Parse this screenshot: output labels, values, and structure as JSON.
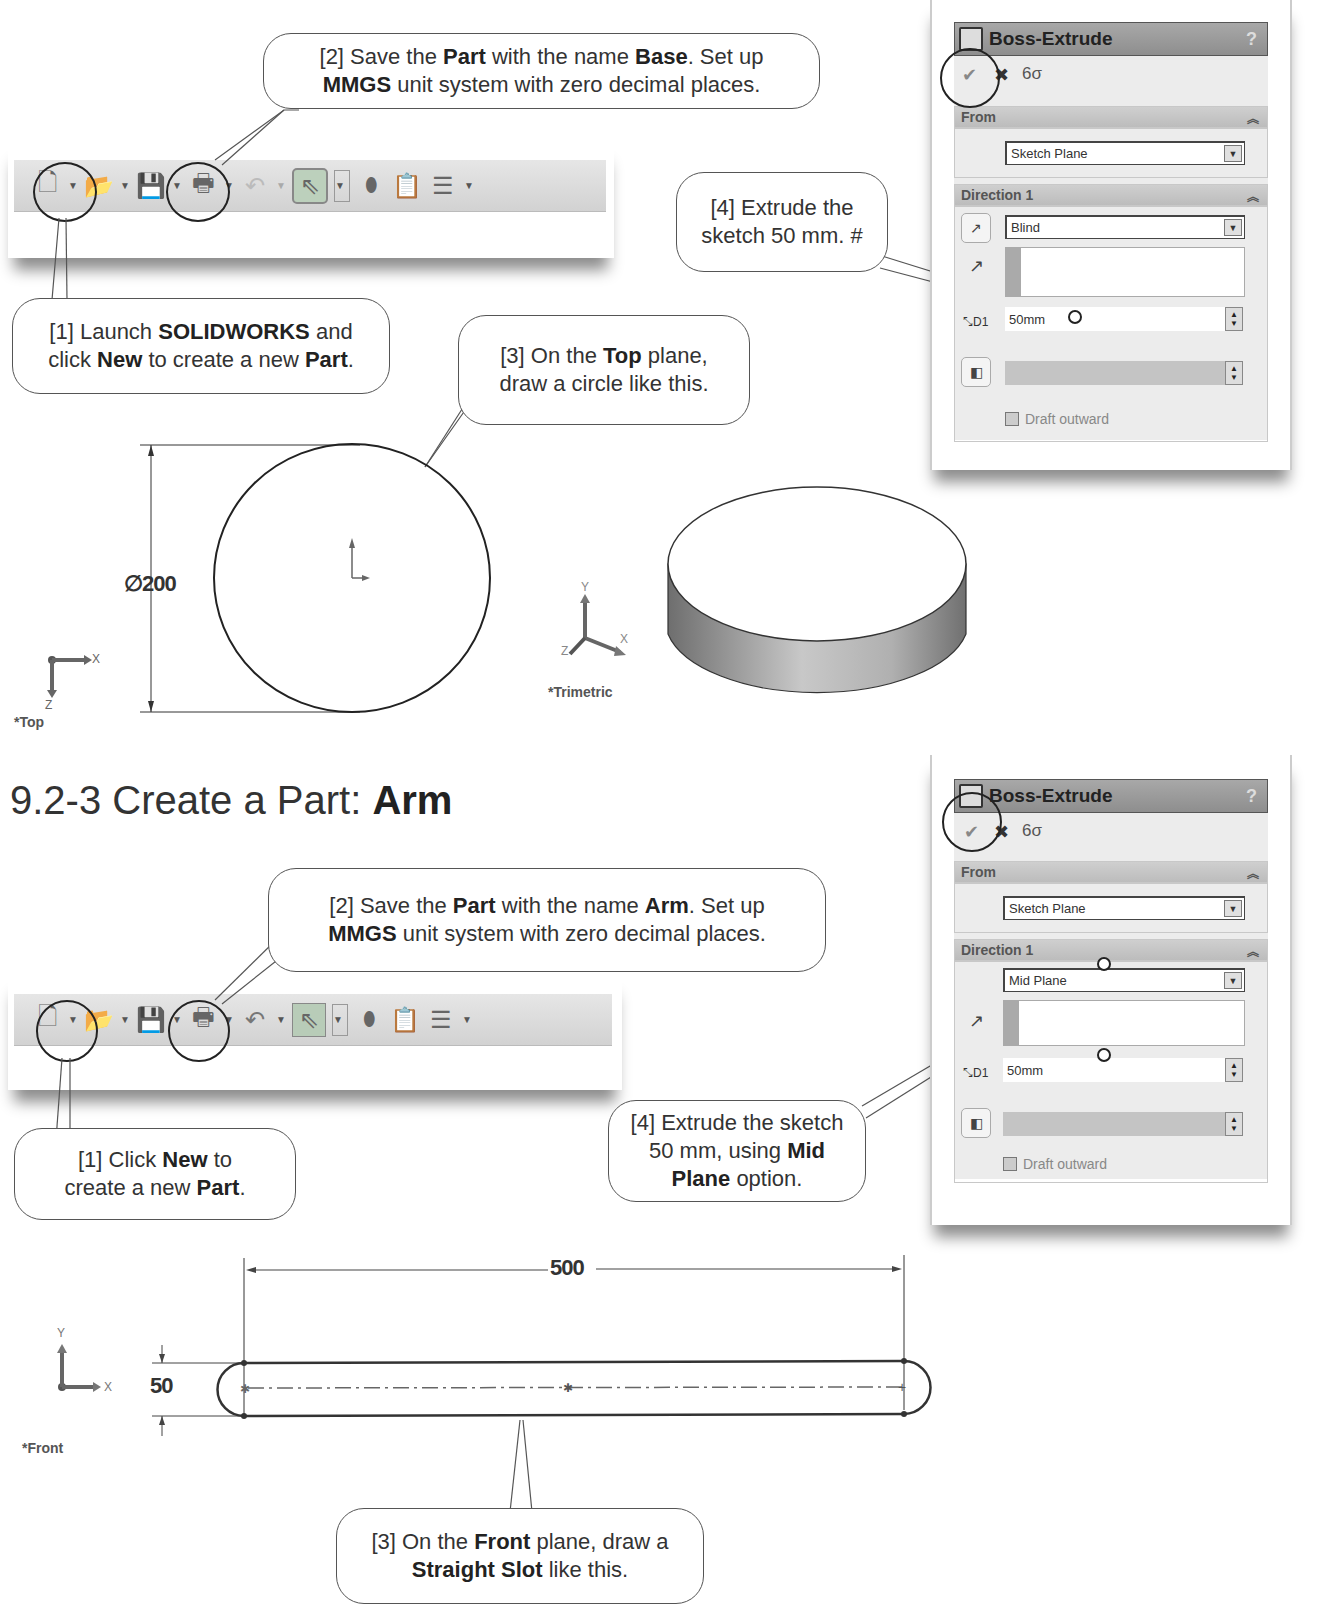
{
  "section_base": {
    "toolbar": {
      "icons": [
        "new-document",
        "open-folder",
        "save-floppy",
        "print",
        "undo",
        "select-arrow",
        "rebuild-traffic-light",
        "file-properties",
        "options-list"
      ]
    },
    "callouts": {
      "step1": {
        "parts": [
          "[1] Launch ",
          "SOLIDWORKS",
          " and",
          "click ",
          "New",
          " to create a new ",
          "Part",
          "."
        ]
      },
      "step2": {
        "parts": [
          "[2] Save the ",
          "Part",
          " with the name ",
          "Base",
          ".  Set up",
          "MMGS",
          " unit system with zero decimal places."
        ]
      },
      "step3": {
        "parts": [
          "[3] On the ",
          "Top",
          " plane,",
          "draw a circle like this."
        ]
      },
      "step4": {
        "line1": "[4] Extrude the",
        "line2": "sketch 50 mm. #"
      }
    },
    "property_manager": {
      "title": "Boss-Extrude",
      "help": "?",
      "ok_icon": "✔",
      "cancel_icon": "✖",
      "preview_icon": "6σ",
      "from_label": "From",
      "from_value": "Sketch Plane",
      "direction_label": "Direction 1",
      "end_condition": "Blind",
      "depth": "50mm",
      "draft_label": "Draft outward"
    },
    "sketch": {
      "diameter_label": "∅200",
      "view_label": "*Top",
      "axis_x": "X",
      "axis_z": "Z"
    },
    "model": {
      "view_label": "*Trimetric",
      "axis_x": "X",
      "axis_y": "Y",
      "axis_z": "Z"
    }
  },
  "section_arm": {
    "heading_prefix": "9.2-3  Create a Part: ",
    "heading_bold": "Arm",
    "toolbar": {
      "icons": [
        "new-document",
        "open-folder",
        "save-floppy",
        "print",
        "undo",
        "select-arrow",
        "rebuild-traffic-light",
        "file-properties",
        "options-list"
      ]
    },
    "callouts": {
      "step1": {
        "parts": [
          "[1] Click ",
          "New",
          " to",
          "create a new ",
          "Part",
          "."
        ]
      },
      "step2": {
        "parts": [
          "[2] Save the ",
          "Part",
          " with the name ",
          "Arm",
          ".  Set up",
          "MMGS",
          " unit system with zero decimal places."
        ]
      },
      "step3": {
        "parts": [
          "[3] On the ",
          "Front",
          " plane, draw a",
          "Straight Slot",
          " like this."
        ]
      },
      "step4": {
        "parts": [
          "[4] Extrude the sketch",
          "50 mm, using ",
          "Mid",
          "Plane",
          " option."
        ]
      }
    },
    "property_manager": {
      "title": "Boss-Extrude",
      "help": "?",
      "ok_icon": "✔",
      "cancel_icon": "✖",
      "preview_icon": "6σ",
      "from_label": "From",
      "from_value": "Sketch Plane",
      "direction_label": "Direction 1",
      "end_condition": "Mid Plane",
      "depth": "50mm",
      "draft_label": "Draft outward"
    },
    "sketch": {
      "length_label": "500",
      "width_label": "50",
      "view_label": "*Front",
      "axis_x": "X",
      "axis_y": "Y"
    }
  }
}
